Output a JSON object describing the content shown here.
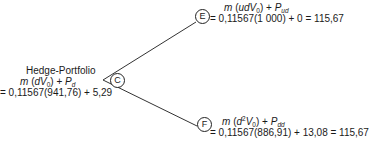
{
  "root": {
    "label": "C",
    "title": "Hedge-Portfolio",
    "formula": {
      "m": "m",
      "open": "(",
      "d": "d",
      "V": "V",
      "sub0": "0",
      "close": ")",
      "plus": " + ",
      "P": "P",
      "subP": "d"
    },
    "value_line": "= 0,11567(941,76) + 5,29"
  },
  "up_node": {
    "label": "E",
    "formula": {
      "m": "m",
      "open": "(",
      "ud": "ud",
      "V": "V",
      "sub0": "0",
      "close": ")",
      "plus": " + ",
      "P": "P",
      "subP": "ud"
    },
    "value_line": "= 0,11567(1 000) + 0 = 115,67"
  },
  "down_node": {
    "label": "F",
    "formula": {
      "m": "m",
      "open": "(",
      "d": "d",
      "sup2": "2",
      "V": "V",
      "sub0": "0",
      "close": ")",
      "plus": " + ",
      "P": "P",
      "subP": "dd"
    },
    "value_line": "= 0,11567(886,91) + 13,08 = 115,67"
  }
}
